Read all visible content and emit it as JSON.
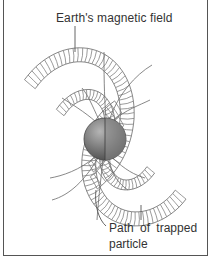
{
  "diagram": {
    "title_label": "Earth's magnetic field",
    "particle_label_line1": "Path of trapped",
    "particle_label_line2": "particle",
    "colors": {
      "border": "#555555",
      "lines": "#6a6a6a",
      "earth_dark": "#555555",
      "earth_light": "#9a9a9a",
      "text": "#333333"
    }
  }
}
